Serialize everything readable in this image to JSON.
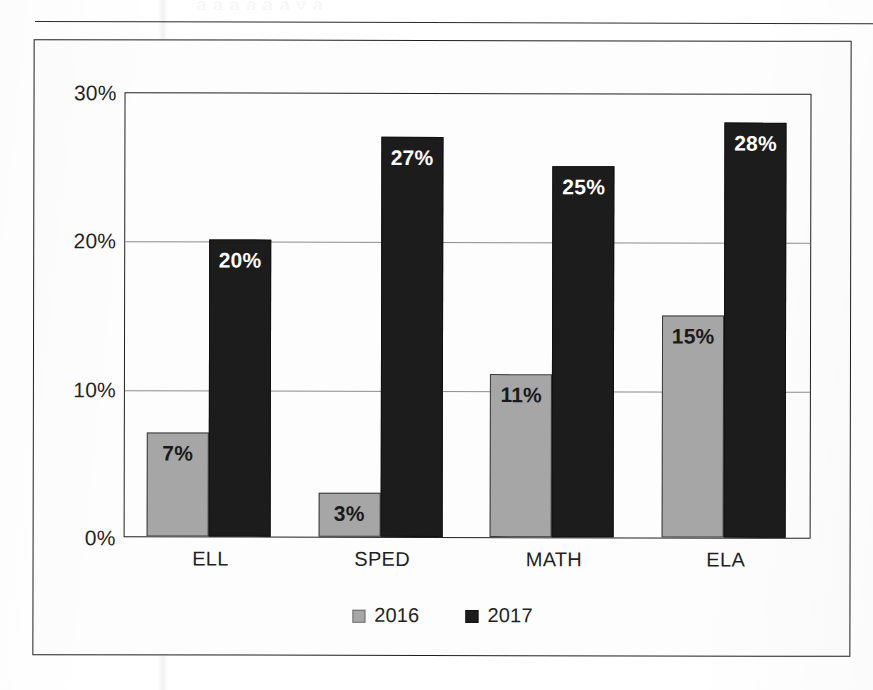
{
  "figure": {
    "ghost_text": "a a a a a a y a",
    "frame_border_color": "#1f1f1f",
    "background_color": "#ffffff"
  },
  "chart_data": {
    "type": "bar",
    "title": "",
    "subtitle": "",
    "xlabel": "",
    "ylabel": "",
    "categories": [
      "ELL",
      "SPED",
      "MATH",
      "ELA"
    ],
    "series": [
      {
        "name": "2016",
        "color": "#a6a6a6",
        "values": [
          7,
          3,
          11,
          15
        ],
        "labels": [
          "7%",
          "3%",
          "11%",
          "15%"
        ]
      },
      {
        "name": "2017",
        "color": "#1c1c1c",
        "values": [
          20,
          27,
          25,
          28
        ],
        "labels": [
          "20%",
          "27%",
          "25%",
          "28%"
        ]
      }
    ],
    "ylim": [
      0,
      30
    ],
    "yticks": [
      0,
      10,
      20,
      30
    ],
    "ytick_labels": [
      "0%",
      "10%",
      "20%",
      "30%"
    ],
    "grid": "horizontal",
    "legend_position": "bottom-center",
    "value_labels_inside": true,
    "units": "percent"
  }
}
